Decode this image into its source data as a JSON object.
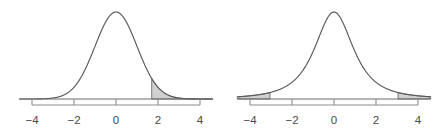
{
  "figure": {
    "title": "",
    "background_color": "#ffffff",
    "panel_count": 2
  },
  "style": {
    "curve_color": "#595959",
    "shade_fill": "#cfcfcf",
    "shade_edge": "#6e6e6e",
    "axis_color": "#8d8d8d",
    "baseline_color": "#6b6b6b",
    "label_color": "#4a4a4a"
  },
  "chart_data": [
    {
      "type": "area",
      "title": "",
      "subtitle": "",
      "xlabel": "",
      "ylabel": "",
      "panel_name": "left-normal-curve",
      "distribution": "normal",
      "mean": 0,
      "sd": 1,
      "peak_height": 0.399,
      "xlim": [
        -4.6,
        4.6
      ],
      "ylim": [
        0,
        0.42
      ],
      "grid": false,
      "legend": false,
      "axis_ticks": [
        -4,
        -2,
        0,
        2,
        4
      ],
      "tick_labels": [
        "−4",
        "−2",
        "0",
        "2",
        "4"
      ],
      "shaded_regions": [
        {
          "name": "right-tail",
          "from": 1.7,
          "to": 4.6,
          "side": "upper",
          "fill": "#cfcfcf"
        }
      ],
      "x": [
        -4.6,
        -4.2,
        -3.8,
        -3.4,
        -3.0,
        -2.6,
        -2.2,
        -1.8,
        -1.4,
        -1.0,
        -0.6,
        -0.2,
        0.0,
        0.2,
        0.6,
        1.0,
        1.4,
        1.7,
        1.8,
        2.2,
        2.6,
        3.0,
        3.4,
        3.8,
        4.2,
        4.6
      ],
      "y": [
        1e-05,
        6e-05,
        0.0003,
        0.0012,
        0.0044,
        0.0136,
        0.0355,
        0.079,
        0.1497,
        0.242,
        0.3332,
        0.391,
        0.3989,
        0.391,
        0.3332,
        0.242,
        0.1497,
        0.094,
        0.079,
        0.0355,
        0.0136,
        0.0044,
        0.0012,
        0.0003,
        6e-05,
        1e-05
      ]
    },
    {
      "type": "area",
      "title": "",
      "subtitle": "",
      "xlabel": "",
      "ylabel": "",
      "panel_name": "right-heavy-tail-curve",
      "distribution": "t",
      "mean": 0,
      "df": 2,
      "peak_height": 0.399,
      "xlim": [
        -4.6,
        4.6
      ],
      "ylim": [
        0,
        0.42
      ],
      "grid": false,
      "legend": false,
      "axis_ticks": [
        -4,
        -2,
        0,
        2,
        4
      ],
      "tick_labels": [
        "−4",
        "−2",
        "0",
        "2",
        "4"
      ],
      "shaded_regions": [
        {
          "name": "left-tail",
          "from": -4.6,
          "to": -3.05,
          "side": "lower",
          "fill": "#cfcfcf"
        },
        {
          "name": "right-tail",
          "from": 3.05,
          "to": 4.6,
          "side": "upper",
          "fill": "#cfcfcf"
        }
      ],
      "x": [
        -4.6,
        -4.2,
        -3.8,
        -3.4,
        -3.05,
        -2.6,
        -2.2,
        -1.8,
        -1.4,
        -1.0,
        -0.6,
        -0.2,
        0.0,
        0.2,
        0.6,
        1.0,
        1.4,
        1.8,
        2.2,
        2.6,
        3.05,
        3.4,
        3.8,
        4.2,
        4.6
      ],
      "y": [
        0.0115,
        0.0145,
        0.0188,
        0.0249,
        0.033,
        0.047,
        0.064,
        0.089,
        0.124,
        0.173,
        0.238,
        0.313,
        0.3989,
        0.313,
        0.238,
        0.173,
        0.124,
        0.089,
        0.064,
        0.047,
        0.033,
        0.0249,
        0.0188,
        0.0145,
        0.0115
      ]
    }
  ],
  "panels": [
    {
      "id": "left",
      "name": "normal-distribution-plot",
      "axis": {
        "ticks": [
          {
            "value": -4,
            "label": "−4"
          },
          {
            "value": -2,
            "label": "−2"
          },
          {
            "value": 0,
            "label": "0"
          },
          {
            "value": 2,
            "label": "2"
          },
          {
            "value": 4,
            "label": "4"
          }
        ]
      }
    },
    {
      "id": "right",
      "name": "t-distribution-plot",
      "axis": {
        "ticks": [
          {
            "value": -4,
            "label": "−4"
          },
          {
            "value": -2,
            "label": "−2"
          },
          {
            "value": 0,
            "label": "0"
          },
          {
            "value": 2,
            "label": "2"
          },
          {
            "value": 4,
            "label": "4"
          }
        ]
      }
    }
  ]
}
